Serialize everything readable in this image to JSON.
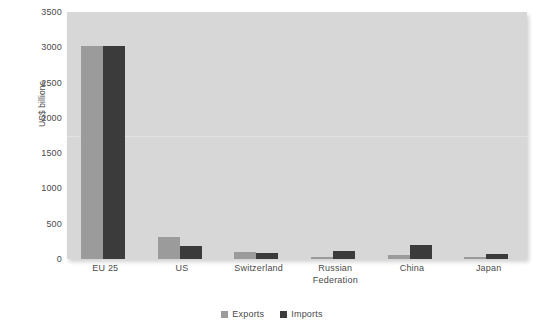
{
  "chart_data": {
    "type": "bar",
    "title": "",
    "subtitle": "",
    "xlabel": "",
    "ylabel": "US$ billions",
    "ylim": [
      0,
      3500
    ],
    "yticks": [
      0,
      500,
      1000,
      1500,
      2000,
      2500,
      3000,
      3500
    ],
    "ytick_labels": [
      "0",
      "500",
      "1000",
      "1500",
      "2000",
      "2500",
      "3000",
      "3500"
    ],
    "grid": true,
    "gridlines": [
      1750
    ],
    "legend_position": "bottom-center",
    "categories": [
      "EU 25",
      "US",
      "Switzerland",
      "Russian Federation",
      "China",
      "Japan"
    ],
    "category_label_lines": [
      [
        "EU 25"
      ],
      [
        "US"
      ],
      [
        "Switzerland"
      ],
      [
        "Russian",
        "Federation"
      ],
      [
        "China"
      ],
      [
        "Japan"
      ]
    ],
    "series": [
      {
        "name": "Exports",
        "color": "#9b9b9b",
        "values": [
          3020,
          305,
          100,
          25,
          60,
          30
        ]
      },
      {
        "name": "Imports",
        "color": "#3b3b3b",
        "values": [
          3020,
          190,
          80,
          110,
          205,
          70
        ]
      }
    ]
  },
  "colors": {
    "plot_background": "#d7d7d7",
    "page_background": "#ffffff",
    "exports": "#9b9b9b",
    "imports": "#3b3b3b",
    "gridline": "#e2e2e2",
    "text": "#4a4a4a"
  },
  "legend": {
    "items": [
      {
        "label": "Exports",
        "color": "#9b9b9b"
      },
      {
        "label": "Imports",
        "color": "#3b3b3b"
      }
    ]
  }
}
